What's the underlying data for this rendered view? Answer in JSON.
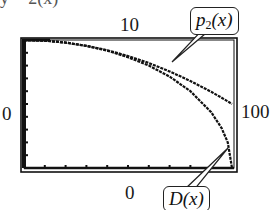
{
  "caption_fragment": "y = 2(x)",
  "window": {
    "ymax_label": "10",
    "ymin_label": "0",
    "xmin_label": "0",
    "xmax_label": "100"
  },
  "callouts": {
    "p2": {
      "name": "p",
      "sub": "2",
      "arg": "(x)"
    },
    "d": {
      "name": "D",
      "arg": "(x)"
    }
  },
  "chart_data": {
    "type": "line",
    "title": "",
    "xlabel": "",
    "ylabel": "",
    "xlim": [
      0,
      100
    ],
    "ylim": [
      0,
      10
    ],
    "xticks_step": 10,
    "yticks_step": 1,
    "grid": false,
    "legend": "callout labels",
    "x": [
      0,
      10,
      20,
      30,
      40,
      50,
      60,
      70,
      80,
      90,
      95,
      98,
      100
    ],
    "series": [
      {
        "name": "p2(x)",
        "values": [
          10,
          9.95,
          9.8,
          9.55,
          9.2,
          8.75,
          8.2,
          7.55,
          6.8,
          5.95,
          5.49,
          5.2,
          5.0
        ]
      },
      {
        "name": "D(x)",
        "values": [
          10,
          9.95,
          9.8,
          9.54,
          9.17,
          8.66,
          8.0,
          7.14,
          6.0,
          4.36,
          3.12,
          1.99,
          0
        ]
      }
    ],
    "annotations": [
      "p2(x)",
      "D(x)"
    ],
    "colors": {
      "frame": "#111111",
      "curve": "#111111",
      "background": "#ffffff"
    }
  }
}
